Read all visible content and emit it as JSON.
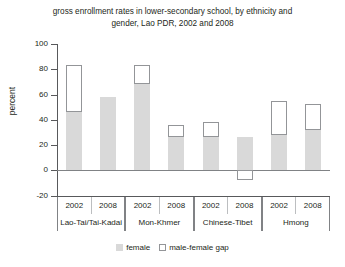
{
  "chart_data": {
    "type": "bar",
    "title": "gross enrollment rates in lower-secondary school, by ethnicity and gender, Lao PDR, 2002 and 2008",
    "title_line1": "gross enrollment rates in lower-secondary school, by ethnicity and",
    "title_line2": "gender, Lao PDR, 2002 and 2008",
    "xlabel": "",
    "ylabel": "percent",
    "ylim": [
      -20,
      100
    ],
    "ytick_values": [
      100,
      80,
      60,
      40,
      20,
      0,
      -20
    ],
    "ytick_labels": [
      "100",
      "80",
      "60",
      "40",
      "20",
      "0",
      "-20"
    ],
    "grid": false,
    "stacked": true,
    "legend_position": "bottom",
    "categories": [
      "Lao-Tai/Tai-Kadai 2002",
      "Lao-Tai/Tai-Kadai 2008",
      "Mon-Khmer 2002",
      "Mon-Khmer 2008",
      "Chinese-Tibet 2002",
      "Chinese-Tibet 2008",
      "Hmong 2002",
      "Hmong 2008"
    ],
    "groups": [
      {
        "ethnicity": "Lao-Tai/Tai-Kadai",
        "years": [
          "2002",
          "2008"
        ]
      },
      {
        "ethnicity": "Mon-Khmer",
        "years": [
          "2002",
          "2008"
        ]
      },
      {
        "ethnicity": "Chinese-Tibet",
        "years": [
          "2002",
          "2008"
        ]
      },
      {
        "ethnicity": "Hmong",
        "years": [
          "2002",
          "2008"
        ]
      }
    ],
    "series": [
      {
        "name": "female",
        "color": "#d9d9d9",
        "values": [
          46,
          58,
          68,
          26,
          26,
          26,
          28,
          32
        ]
      },
      {
        "name": "male-female gap",
        "color": "#ffffff",
        "values": [
          37,
          0,
          15,
          10,
          12,
          -8,
          27,
          20
        ]
      }
    ],
    "male_totals": [
      83,
      58,
      83,
      36,
      38,
      18,
      55,
      52
    ],
    "bars": [
      {
        "group": "Lao-Tai/Tai-Kadai",
        "year": "2002",
        "female": 46,
        "gap": 37,
        "male": 83
      },
      {
        "group": "Lao-Tai/Tai-Kadai",
        "year": "2008",
        "female": 58,
        "gap": 0,
        "male": 58
      },
      {
        "group": "Mon-Khmer",
        "year": "2002",
        "female": 68,
        "gap": 15,
        "male": 83
      },
      {
        "group": "Mon-Khmer",
        "year": "2008",
        "female": 26,
        "gap": 10,
        "male": 36
      },
      {
        "group": "Chinese-Tibet",
        "year": "2002",
        "female": 26,
        "gap": 12,
        "male": 38
      },
      {
        "group": "Chinese-Tibet",
        "year": "2008",
        "female": 26,
        "gap": -8,
        "male": 18
      },
      {
        "group": "Hmong",
        "year": "2002",
        "female": 28,
        "gap": 27,
        "male": 55
      },
      {
        "group": "Hmong",
        "year": "2008",
        "female": 32,
        "gap": 20,
        "male": 52
      }
    ],
    "legend": [
      {
        "label": "female",
        "swatch": "filled-gray"
      },
      {
        "label": "male-female gap",
        "swatch": "outlined-white"
      }
    ]
  },
  "colors": {
    "female_fill": "#d9d9d9",
    "gap_fill": "#ffffff",
    "gap_stroke": "#939598",
    "axis": "#58595b",
    "text": "#231f20",
    "background": "#ffffff"
  }
}
